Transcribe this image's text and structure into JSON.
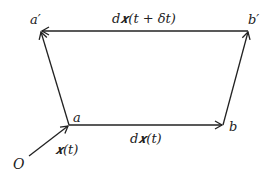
{
  "diagram": {
    "type": "vector-parallelogram",
    "colors": {
      "stroke": "#222222",
      "background": "#ffffff"
    },
    "points": {
      "O": {
        "label": "O",
        "x": 29,
        "y": 156
      },
      "a": {
        "label": "a",
        "x": 69,
        "y": 125
      },
      "b": {
        "label": "b",
        "x": 223,
        "y": 125
      },
      "a_prime": {
        "label": "a′",
        "x": 41,
        "y": 31
      },
      "b_prime": {
        "label": "b′",
        "x": 248,
        "y": 31
      }
    },
    "vectors": [
      {
        "from": "O",
        "to": "a",
        "label": "x(t)"
      },
      {
        "from": "a",
        "to": "b",
        "label": "dx(t)"
      },
      {
        "from": "a",
        "to": "a_prime",
        "label": ""
      },
      {
        "from": "b",
        "to": "b_prime",
        "label": ""
      },
      {
        "from": "b_prime",
        "to": "a_prime",
        "label": "dx(t + δt)"
      }
    ],
    "labels": {
      "O": "O",
      "a": "a",
      "b": "b",
      "a_prime": "a′",
      "b_prime": "b′",
      "x_t": "𝒙(t)",
      "dx_t": "d𝒙(t)",
      "dx_t_dt": "d𝒙(t + δt)"
    }
  }
}
